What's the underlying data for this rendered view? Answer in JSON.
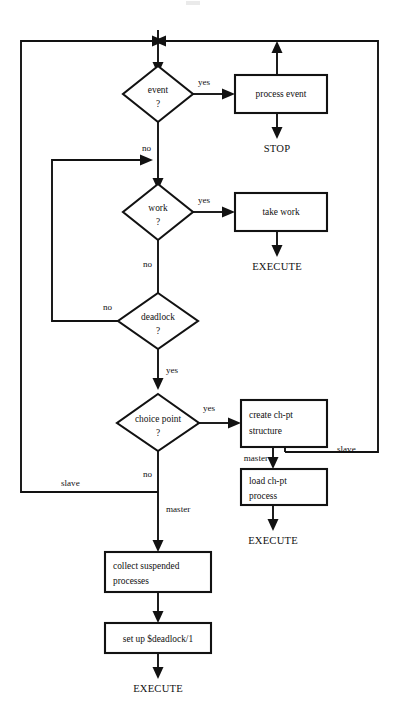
{
  "diagram": {
    "colors": {
      "line": "#121212",
      "background": "#ffffff",
      "text": "#111111"
    },
    "decisions": [
      {
        "id": "event",
        "line1": "event",
        "line2": "?"
      },
      {
        "id": "work",
        "line1": "work",
        "line2": "?"
      },
      {
        "id": "deadlock",
        "line1": "deadlock",
        "line2": "?"
      },
      {
        "id": "choice-point",
        "line1": "choice point",
        "line2": "?"
      }
    ],
    "processes": [
      {
        "id": "process-event",
        "line1": "process event",
        "line2": ""
      },
      {
        "id": "take-work",
        "line1": "take work",
        "line2": ""
      },
      {
        "id": "create-chpt-structure",
        "line1": "create ch-pt",
        "line2": "structure"
      },
      {
        "id": "load-chpt-process",
        "line1": "load ch-pt",
        "line2": "process"
      },
      {
        "id": "collect-suspended-processes",
        "line1": "collect suspended",
        "line2": "processes"
      },
      {
        "id": "set-up-deadlock",
        "line1": "set up $deadlock/1",
        "line2": ""
      }
    ],
    "terminals": [
      {
        "id": "stop",
        "label": "STOP"
      },
      {
        "id": "execute-take-work",
        "label": "EXECUTE"
      },
      {
        "id": "execute-load-chpt",
        "label": "EXECUTE"
      },
      {
        "id": "execute-deadlock",
        "label": "EXECUTE"
      }
    ],
    "edge_labels": [
      {
        "id": "event-yes",
        "label": "yes"
      },
      {
        "id": "event-no",
        "label": "no"
      },
      {
        "id": "work-yes",
        "label": "yes"
      },
      {
        "id": "work-no",
        "label": "no"
      },
      {
        "id": "deadlock-no",
        "label": "no"
      },
      {
        "id": "deadlock-yes",
        "label": "yes"
      },
      {
        "id": "choice-point-yes",
        "label": "yes"
      },
      {
        "id": "choice-point-no",
        "label": "no"
      },
      {
        "id": "chpt-master",
        "label": "master"
      },
      {
        "id": "chpt-slave",
        "label": "slave"
      },
      {
        "id": "choice-point-slave",
        "label": "slave"
      },
      {
        "id": "choice-point-master",
        "label": "master"
      }
    ]
  }
}
